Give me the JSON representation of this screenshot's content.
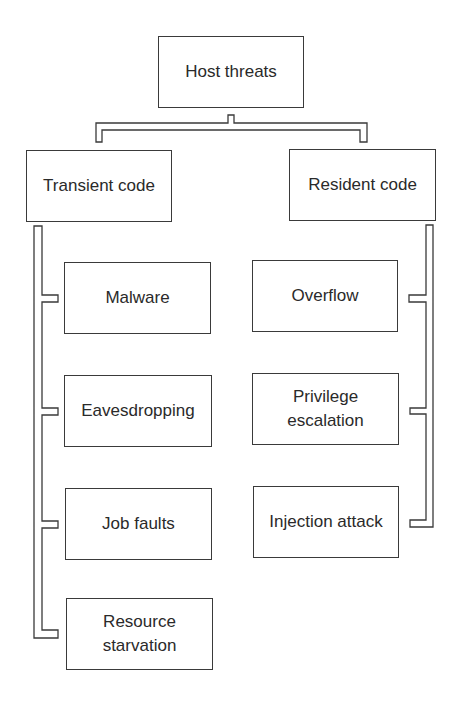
{
  "diagram": {
    "type": "hierarchy-tree",
    "root": {
      "label": "Host threats"
    },
    "branches": [
      {
        "label": "Transient code",
        "children": [
          {
            "label": "Malware"
          },
          {
            "label": "Eavesdropping"
          },
          {
            "label": "Job faults"
          },
          {
            "label": "Resource\nstarvation"
          }
        ]
      },
      {
        "label": "Resident code",
        "children": [
          {
            "label": "Overflow"
          },
          {
            "label": "Privilege\nescalation"
          },
          {
            "label": "Injection attack"
          }
        ]
      }
    ],
    "colors": {
      "line": "#3a3a3a",
      "text": "#2a2a2a",
      "background": "#ffffff"
    }
  }
}
